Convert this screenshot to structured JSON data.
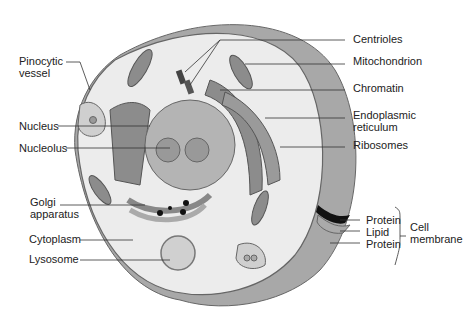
{
  "diagram": {
    "labels_left": [
      {
        "id": "pinocytic",
        "line1": "Pinocytic",
        "line2": "vessel"
      },
      {
        "id": "nucleus",
        "line1": "Nucleus"
      },
      {
        "id": "nucleolus",
        "line1": "Nucleolus"
      },
      {
        "id": "golgi",
        "line1": "Golgi",
        "line2": "apparatus"
      },
      {
        "id": "cytoplasm",
        "line1": "Cytoplasm"
      },
      {
        "id": "lysosome",
        "line1": "Lysosome"
      }
    ],
    "labels_right": [
      {
        "id": "centrioles",
        "line1": "Centrioles"
      },
      {
        "id": "mitochondrion",
        "line1": "Mitochondrion"
      },
      {
        "id": "chromatin",
        "line1": "Chromatin"
      },
      {
        "id": "er",
        "line1": "Endoplasmic",
        "line2": "reticulum"
      },
      {
        "id": "ribosomes",
        "line1": "Ribosomes"
      }
    ],
    "membrane": {
      "layers": [
        "Protein",
        "Lipid",
        "Protein"
      ],
      "group_label_line1": "Cell",
      "group_label_line2": "membrane"
    },
    "colors": {
      "cytoplasm": "#ececec",
      "wall": "#a8a8a8",
      "organelle": "#8c8c8c",
      "nucleus": "#b4b4b4",
      "line": "#333333"
    }
  }
}
